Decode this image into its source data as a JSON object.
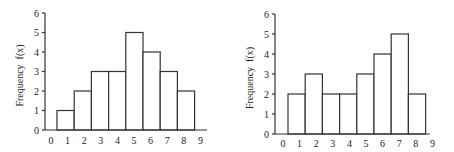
{
  "chart_data": [
    {
      "type": "bar",
      "title": "",
      "xlabel": "",
      "ylabel": "Frequency  f(x)",
      "x_tick_labels": [
        "0",
        "1",
        "2",
        "3",
        "4",
        "5",
        "6",
        "7",
        "8",
        "9"
      ],
      "y_tick_labels": [
        "0",
        "1",
        "2",
        "3",
        "4",
        "5",
        "6"
      ],
      "categories": [
        "1",
        "2",
        "3",
        "4",
        "5",
        "6",
        "7",
        "8"
      ],
      "values": [
        1,
        2,
        3,
        3,
        5,
        4,
        3,
        2
      ],
      "ylim": [
        0,
        6
      ],
      "xlim": [
        0,
        9
      ],
      "grid": false,
      "legend": null
    },
    {
      "type": "bar",
      "title": "",
      "xlabel": "",
      "ylabel": "Frequency  f(x)",
      "x_tick_labels": [
        "0",
        "1",
        "2",
        "3",
        "4",
        "5",
        "6",
        "7",
        "8",
        "9"
      ],
      "y_tick_labels": [
        "0",
        "1",
        "2",
        "3",
        "4",
        "5",
        "6"
      ],
      "categories": [
        "1",
        "2",
        "3",
        "4",
        "5",
        "6",
        "7",
        "8"
      ],
      "values": [
        2,
        3,
        2,
        2,
        3,
        4,
        5,
        2
      ],
      "ylim": [
        0,
        6
      ],
      "xlim": [
        0,
        9
      ],
      "grid": false,
      "legend": null
    }
  ],
  "colors": {
    "bar_fill": "#ffffff",
    "bar_stroke": "#333333",
    "axis": "#333333",
    "text": "#222222"
  }
}
